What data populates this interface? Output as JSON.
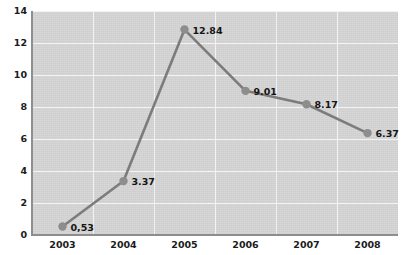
{
  "chart_data": {
    "type": "line",
    "title": "",
    "subtitle": "",
    "xlabel": "",
    "ylabel": "",
    "categories": [
      "2003",
      "2004",
      "2005",
      "2006",
      "2007",
      "2008"
    ],
    "values": [
      0.53,
      3.37,
      12.84,
      9.01,
      8.17,
      6.37
    ],
    "point_labels": [
      "0,53",
      "3.37",
      "12.84",
      "9.01",
      "8.17",
      "6.37"
    ],
    "ylim": [
      0,
      14
    ],
    "xlim": [
      "2003",
      "2008"
    ],
    "yticks": [
      0,
      2,
      4,
      6,
      8,
      10,
      12,
      14
    ],
    "ytick_labels": [
      "0",
      "2",
      "4",
      "6",
      "8",
      "10",
      "12",
      "14"
    ],
    "xtick_labels": [
      "2003",
      "2004",
      "2005",
      "2006",
      "2007",
      "2008"
    ],
    "grid": {
      "horizontal": true,
      "vertical": true,
      "color": "#f2f2f2"
    },
    "legend": {
      "visible": false,
      "position": "none",
      "entries": []
    },
    "series": [
      {
        "name": "",
        "values": [
          0.53,
          3.37,
          12.84,
          9.01,
          8.17,
          6.37
        ],
        "line_color": "#7c7c7c",
        "marker_color": "#8d8d8d",
        "marker": "circle"
      }
    ],
    "style": {
      "plot_background": "#d5d5d5",
      "page_background": "#ffffff",
      "axis_color": "#8e8e8e",
      "text_color": "#1b1b1b"
    }
  }
}
